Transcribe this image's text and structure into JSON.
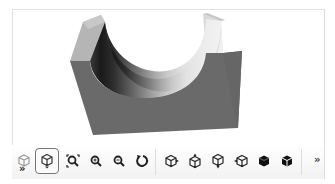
{
  "viewer": {
    "model": {
      "description": "U-channel cradle block (rectangular block with half-cylinder cut)",
      "colors": {
        "front_face": "#6b6b6b",
        "post_top": "#b8b8b8",
        "cut_dark": "#1e1e1e",
        "cut_light": "#efefef"
      }
    }
  },
  "toolbar": {
    "left_overflow_label": "»",
    "right_overflow_label": "»",
    "buttons": [
      {
        "id": "display-mode",
        "title": "Display mode"
      },
      {
        "id": "view-selector",
        "title": "View",
        "active": true
      },
      {
        "id": "zoom-to-fit",
        "title": "Zoom to fit"
      },
      {
        "id": "zoom-in",
        "title": "Zoom in"
      },
      {
        "id": "zoom-out",
        "title": "Zoom out"
      },
      {
        "id": "rotate",
        "title": "Rotate"
      },
      {
        "id": "view-left",
        "title": "Left view"
      },
      {
        "id": "view-front",
        "title": "Front view"
      },
      {
        "id": "view-bottom",
        "title": "Bottom view"
      },
      {
        "id": "view-right",
        "title": "Right view"
      },
      {
        "id": "shaded",
        "title": "Shaded"
      },
      {
        "id": "shaded-edges",
        "title": "Shaded with edges"
      }
    ]
  }
}
